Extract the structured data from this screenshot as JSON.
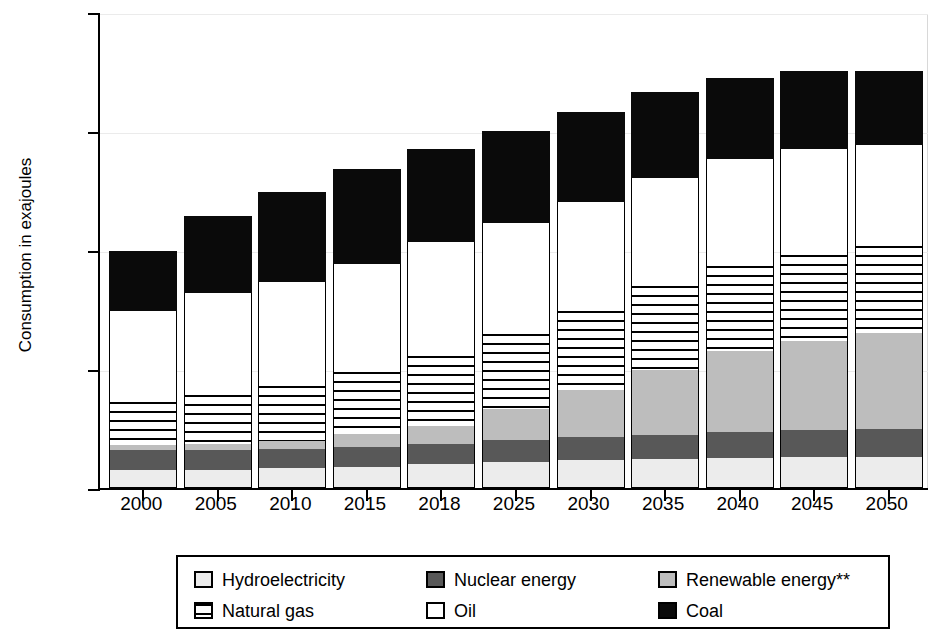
{
  "chart_data": {
    "type": "bar",
    "subtype": "stacked-bar",
    "title": "",
    "xlabel": "",
    "ylabel": "Consumption in exajoules",
    "ylim": [
      0,
      800
    ],
    "yticks": [
      0,
      200,
      400,
      600,
      800
    ],
    "ytick_labels": [
      "0",
      "200",
      "400",
      "600",
      "800"
    ],
    "grid": false,
    "legend_position": "bottom",
    "legend_note": "**",
    "categories": [
      "2000",
      "2005",
      "2010",
      "2015",
      "2018",
      "2025",
      "2030",
      "2035",
      "2040",
      "2045",
      "2050"
    ],
    "stack_order_bottom_to_top": [
      "Hydroelectricity",
      "Nuclear energy",
      "Renewable energy**",
      "Natural gas",
      "Oil",
      "Coal"
    ],
    "series": [
      {
        "name": "Hydroelectricity",
        "color": "#ececec",
        "pattern": "solid-light-gray",
        "values": [
          30,
          31,
          33,
          36,
          40,
          44,
          47,
          49,
          51,
          52,
          52
        ]
      },
      {
        "name": "Nuclear energy",
        "color": "#585858",
        "pattern": "solid-dark-gray",
        "values": [
          34,
          33,
          32,
          33,
          34,
          36,
          38,
          40,
          43,
          45,
          48
        ]
      },
      {
        "name": "Renewable energy**",
        "color": "#bdbdbd",
        "pattern": "solid-medium-gray",
        "values": [
          8,
          10,
          14,
          22,
          30,
          52,
          80,
          110,
          136,
          150,
          160
        ]
      },
      {
        "name": "Natural gas",
        "color": "#ffffff",
        "pattern": "horizontal-stripes",
        "values": [
          72,
          82,
          92,
          104,
          118,
          127,
          133,
          140,
          143,
          145,
          147
        ]
      },
      {
        "name": "Oil",
        "color": "#ffffff",
        "pattern": "solid-white",
        "values": [
          153,
          171,
          175,
          182,
          191,
          186,
          183,
          182,
          180,
          177,
          170
        ]
      },
      {
        "name": "Coal",
        "color": "#0a0a0a",
        "pattern": "solid-black",
        "values": [
          99,
          129,
          150,
          158,
          155,
          154,
          149,
          143,
          134,
          130,
          123
        ]
      }
    ],
    "totals": [
      396,
      456,
      496,
      535,
      568,
      599,
      630,
      664,
      687,
      699,
      700
    ]
  },
  "legend": {
    "items": [
      {
        "label": "Hydroelectricity",
        "swatch": "hydro-swatch",
        "style": "solid-light-gray"
      },
      {
        "label": "Nuclear energy",
        "swatch": "nuclear-swatch",
        "style": "solid-dark-gray"
      },
      {
        "label": "Renewable energy**",
        "swatch": "renew-swatch",
        "style": "solid-medium-gray"
      },
      {
        "label": "Natural gas",
        "swatch": "gas-swatch",
        "style": "horizontal-stripes"
      },
      {
        "label": "Oil",
        "swatch": "oil-swatch",
        "style": "solid-white"
      },
      {
        "label": "Coal",
        "swatch": "coal-swatch",
        "style": "solid-black"
      }
    ]
  }
}
